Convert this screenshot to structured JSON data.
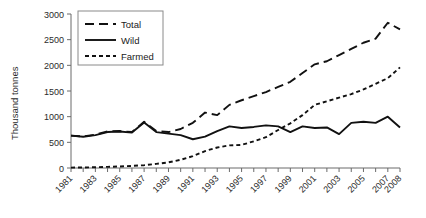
{
  "chart_data": {
    "type": "line",
    "title": "",
    "xlabel": "",
    "ylabel": "Thousand tonnes",
    "ylim": [
      0,
      3000
    ],
    "xlim": [
      1981,
      2008
    ],
    "grid": false,
    "legend_position": "top-left",
    "yticks": [
      0,
      500,
      1000,
      1500,
      2000,
      2500,
      3000
    ],
    "ytick_labels": [
      "0",
      "500",
      "1000",
      "1500",
      "2000",
      "2500",
      "3000"
    ],
    "x": [
      1981,
      1982,
      1983,
      1984,
      1985,
      1986,
      1987,
      1988,
      1989,
      1990,
      1991,
      1992,
      1993,
      1994,
      1995,
      1996,
      1997,
      1998,
      1999,
      2000,
      2001,
      2002,
      2003,
      2004,
      2005,
      2006,
      2007,
      2008
    ],
    "xtick_labels": [
      "1981",
      "1983",
      "1985",
      "1987",
      "1989",
      "1991",
      "1993",
      "1995",
      "1997",
      "1999",
      "2001",
      "2003",
      "2005",
      "2007",
      "2008"
    ],
    "xticks_major": [
      1981,
      1983,
      1985,
      1987,
      1989,
      1991,
      1993,
      1995,
      1997,
      1999,
      2001,
      2003,
      2005,
      2007,
      2008
    ],
    "series": [
      {
        "name": "Total",
        "style": "long-dash",
        "values": [
          630,
          615,
          650,
          715,
          720,
          700,
          900,
          720,
          700,
          760,
          880,
          1080,
          1030,
          1230,
          1320,
          1400,
          1480,
          1580,
          1680,
          1850,
          2020,
          2080,
          2200,
          2320,
          2440,
          2520,
          2830,
          2700
        ]
      },
      {
        "name": "Wild",
        "style": "solid",
        "values": [
          630,
          610,
          640,
          700,
          710,
          690,
          885,
          700,
          670,
          640,
          560,
          610,
          720,
          810,
          780,
          800,
          830,
          810,
          700,
          810,
          780,
          790,
          660,
          880,
          900,
          880,
          1000,
          790
        ]
      },
      {
        "name": "Farmed",
        "style": "short-dash",
        "values": [
          8,
          10,
          15,
          22,
          30,
          40,
          55,
          80,
          110,
          160,
          230,
          330,
          400,
          440,
          450,
          520,
          600,
          740,
          870,
          1030,
          1230,
          1300,
          1370,
          1440,
          1530,
          1640,
          1750,
          1960
        ]
      }
    ],
    "legend": [
      {
        "label": "Total",
        "style": "long-dash"
      },
      {
        "label": "Wild",
        "style": "solid"
      },
      {
        "label": "Farmed",
        "style": "short-dash"
      }
    ]
  }
}
